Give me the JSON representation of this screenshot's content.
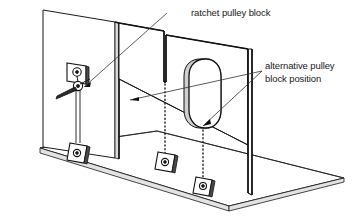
{
  "diagram": {
    "background_color": "#ffffff",
    "line_color": "#1a1a1a",
    "labels": {
      "ratchet_pulley_block": "ratchet pulley block",
      "alternative_pulley_line1": "alternative pulley",
      "alternative_pulley_line2": "block position"
    },
    "components": {
      "left_wall": "left vertical panel",
      "rear_wall": "notched rear panel",
      "right_wall": "right vertical panel",
      "floor_slab": "horizontal base slab",
      "ratchet_pulley": "wall mounted ratchet pulley block with lever",
      "oval_opening": "obround opening in right panel",
      "anchor_blocks": [
        "floor anchor block left",
        "floor anchor block centre",
        "floor anchor block right"
      ],
      "rope": "cable from pulley to left anchor block",
      "dotted_drop_lines": [
        "dotted plumb line at rear notch",
        "dotted plumb line below oval opening"
      ]
    },
    "leaders": {
      "ratchet_leader": "line from ratchet pulley block text to pulley",
      "alt_leader_1": "line to dotted plumb line at rear notch",
      "alt_leader_2": "line to base of oval opening"
    }
  }
}
